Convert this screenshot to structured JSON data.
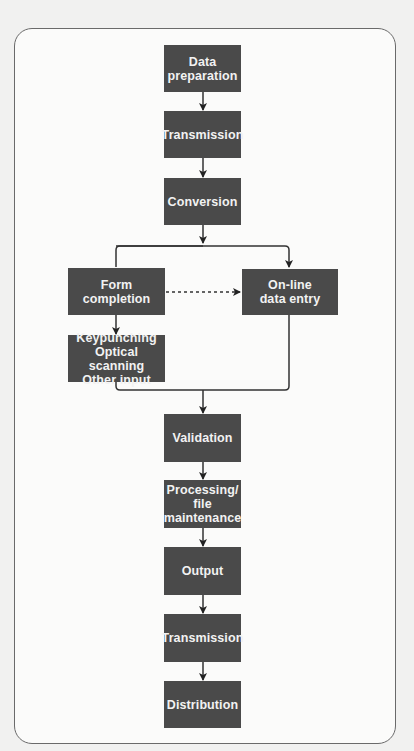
{
  "diagram": {
    "type": "flowchart",
    "nodes": [
      {
        "id": "data-preparation",
        "label": "Data\npreparation"
      },
      {
        "id": "transmission-1",
        "label": "Transmission"
      },
      {
        "id": "conversion",
        "label": "Conversion"
      },
      {
        "id": "form-completion",
        "label": "Form\ncompletion"
      },
      {
        "id": "online-data-entry",
        "label": "On-line\ndata entry"
      },
      {
        "id": "input-methods",
        "label": "Keypunching\nOptical scanning\nOther input"
      },
      {
        "id": "validation",
        "label": "Validation"
      },
      {
        "id": "processing",
        "label": "Processing/\nfile\nmaintenance"
      },
      {
        "id": "output",
        "label": "Output"
      },
      {
        "id": "transmission-2",
        "label": "Transmission"
      },
      {
        "id": "distribution",
        "label": "Distribution"
      }
    ],
    "edges": [
      {
        "from": "data-preparation",
        "to": "transmission-1",
        "style": "solid"
      },
      {
        "from": "transmission-1",
        "to": "conversion",
        "style": "solid"
      },
      {
        "from": "conversion",
        "to": "form-completion",
        "style": "solid"
      },
      {
        "from": "conversion",
        "to": "online-data-entry",
        "style": "solid"
      },
      {
        "from": "form-completion",
        "to": "online-data-entry",
        "style": "dashed"
      },
      {
        "from": "form-completion",
        "to": "input-methods",
        "style": "solid"
      },
      {
        "from": "input-methods",
        "to": "validation",
        "style": "solid"
      },
      {
        "from": "online-data-entry",
        "to": "validation",
        "style": "solid"
      },
      {
        "from": "validation",
        "to": "processing",
        "style": "solid"
      },
      {
        "from": "processing",
        "to": "output",
        "style": "solid"
      },
      {
        "from": "output",
        "to": "transmission-2",
        "style": "solid"
      },
      {
        "from": "transmission-2",
        "to": "distribution",
        "style": "solid"
      }
    ]
  },
  "colors": {
    "box": "#4a4a4a",
    "box_text": "#f2f2f2",
    "line": "#333333",
    "frame": "#6a6a6a"
  }
}
